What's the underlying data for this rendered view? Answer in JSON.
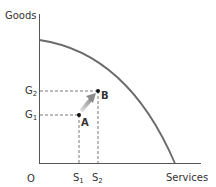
{
  "diagram": {
    "type": "production-possibility-frontier",
    "y_axis_label": "Goods",
    "x_axis_label": "Services",
    "origin_label": "O",
    "y_ticks": [
      {
        "base": "G",
        "sub": "2"
      },
      {
        "base": "G",
        "sub": "1"
      }
    ],
    "x_ticks": [
      {
        "base": "S",
        "sub": "1"
      },
      {
        "base": "S",
        "sub": "2"
      }
    ],
    "points": [
      {
        "label": "A",
        "x_tick": "S1",
        "y_tick": "G1"
      },
      {
        "label": "B",
        "x_tick": "S2",
        "y_tick": "G2"
      }
    ],
    "arrow": {
      "from": "A",
      "to": "B"
    },
    "colors": {
      "axis": "#555555",
      "curve": "#666666",
      "dashed": "#555555",
      "arrow": "#a8a8a8",
      "text": "#333333"
    }
  }
}
